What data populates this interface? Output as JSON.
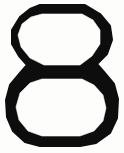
{
  "image": {
    "kind": "glyph-figure",
    "description": "Bold stencil-style numeral eight formed by two stacked octagonal rings",
    "character": "8",
    "character_name": "digit-eight",
    "style": "octagonal outline, thick uniform stroke",
    "width": 124,
    "height": 153
  },
  "colors": {
    "background": "#fdfdfb",
    "ink": "#0d0d0d",
    "hole": "#fdfdfb"
  },
  "geometry": {
    "outer_left": 6,
    "outer_right": 118,
    "outer_top": 5,
    "outer_bottom": 146,
    "waist_top": 66,
    "waist_bottom": 77,
    "stroke_thickness": 10,
    "upper_loop": {
      "top": 5,
      "bottom": 72,
      "hole_left": 18,
      "hole_right": 103,
      "hole_top": 14,
      "hole_bottom": 65
    },
    "lower_loop": {
      "top": 70,
      "bottom": 146,
      "hole_left": 16,
      "hole_right": 106,
      "hole_top": 79,
      "hole_bottom": 136
    }
  },
  "paths": {
    "outer_outline": "M 40,5 L 85,5 L 100,14 L 110,26 L 112,40 L 107,54 L 97,64 L 104,72 L 114,84 L 118,99 L 117,118 L 110,133 L 96,143 L 80,146 L 40,146 L 25,142 L 13,131 L 7,117 L 6,100 L 10,85 L 20,73 L 27,65 L 19,56 L 12,44 L 12,30 L 20,17 L 30,9 Z",
    "upper_hole": "M 42,14 L 82,14 L 93,20 L 100,30 L 100,44 L 92,56 L 80,65 L 44,65 L 30,58 L 21,47 L 18,35 L 22,24 L 31,17 Z",
    "lower_hole": "M 42,79 L 82,79 L 94,85 L 103,95 L 106,108 L 103,121 L 94,131 L 80,136 L 42,136 L 28,131 L 19,120 L 16,107 L 20,93 L 30,83 Z"
  },
  "alt_text": "The numeral 8 drawn as two stacked octagonal rings with a thick black outline"
}
